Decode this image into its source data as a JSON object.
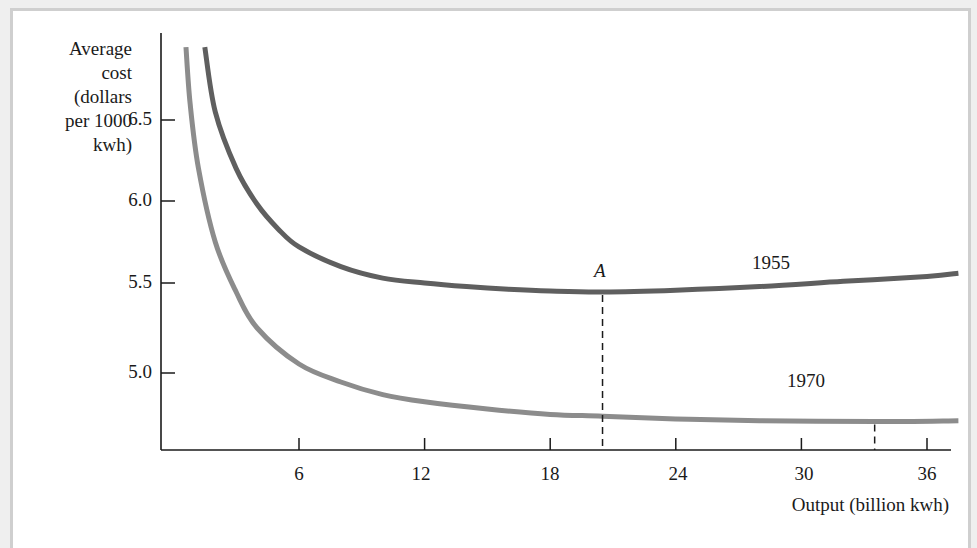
{
  "chart_data": {
    "type": "line",
    "title": "",
    "xlabel": "Output (billion kwh)",
    "ylabel": "Average cost (dollars per 1000 kwh)",
    "ylabel_lines": [
      "Average",
      "cost",
      "(dollars",
      "per 1000",
      "kwh)"
    ],
    "x_ticks": [
      6,
      12,
      18,
      24,
      30,
      36
    ],
    "y_ticks": [
      "6.5",
      "6.0",
      "5.5",
      "5.0"
    ],
    "xlim": [
      0,
      37.5
    ],
    "ylim": [
      4.6,
      7.0
    ],
    "grid": false,
    "legend": "inline labels",
    "series": [
      {
        "name": "1955",
        "color": "#5f5f5f",
        "x": [
          1.5,
          2,
          3,
          4,
          5,
          6,
          8,
          10,
          12,
          14,
          16,
          18,
          20.5,
          24,
          28,
          32,
          36,
          37.5
        ],
        "y": [
          6.95,
          6.55,
          6.2,
          5.98,
          5.83,
          5.72,
          5.6,
          5.53,
          5.5,
          5.48,
          5.465,
          5.455,
          5.45,
          5.46,
          5.48,
          5.51,
          5.54,
          5.56
        ]
      },
      {
        "name": "1970",
        "color": "#8c8c8c",
        "x": [
          0.6,
          0.8,
          1.2,
          2,
          3,
          4,
          6,
          8,
          10,
          12,
          15,
          18,
          20.5,
          24,
          28,
          33.5,
          37.5
        ],
        "y": [
          6.95,
          6.6,
          6.2,
          5.75,
          5.45,
          5.25,
          5.05,
          4.95,
          4.88,
          4.84,
          4.8,
          4.77,
          4.76,
          4.745,
          4.735,
          4.73,
          4.735
        ]
      }
    ],
    "annotations": [
      {
        "text": "A",
        "x": 20.5,
        "y": 5.45,
        "style": "italic",
        "dashed_drop": true
      },
      {
        "text": "1955",
        "series": "1955"
      },
      {
        "text": "1970",
        "series": "1970"
      },
      {
        "text": "",
        "x": 33.5,
        "y": 4.73,
        "dashed_drop": true
      }
    ]
  },
  "labels": {
    "point_a": "A",
    "series_1955": "1955",
    "series_1970": "1970"
  }
}
